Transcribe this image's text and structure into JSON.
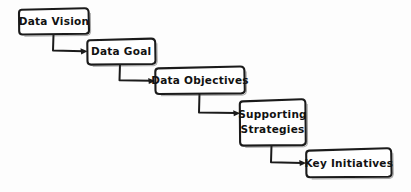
{
  "diagram": {
    "type": "flowchart",
    "orientation": "diagonal-cascade",
    "style": "hand-drawn-sketch",
    "background_color": "#fdfdfd",
    "stroke_color": "#1b1b1b",
    "text_color": "#121212",
    "nodes": [
      {
        "id": "data-vision",
        "label": "Data Vision",
        "lines": [
          "Data Vision"
        ],
        "x": 19,
        "y": 8,
        "width": 70,
        "height": 26
      },
      {
        "id": "data-goal",
        "label": "Data Goal",
        "lines": [
          "Data Goal"
        ],
        "x": 87,
        "y": 38,
        "width": 68,
        "height": 26
      },
      {
        "id": "data-objectives",
        "label": "Data Objectives",
        "lines": [
          "Data Objectives"
        ],
        "x": 155,
        "y": 66,
        "width": 89,
        "height": 27
      },
      {
        "id": "supporting-strategies",
        "label": "Supporting Strategies",
        "lines": [
          "Supporting",
          "Strategies"
        ],
        "x": 240,
        "y": 99,
        "width": 65,
        "height": 46
      },
      {
        "id": "key-initiatives",
        "label": "Key Initiatives",
        "lines": [
          "Key Initiatives"
        ],
        "x": 306,
        "y": 148,
        "width": 85,
        "height": 29
      }
    ],
    "edges": [
      {
        "id": "edge-vision-to-goal",
        "from": "data-vision",
        "to": "data-goal",
        "label": "",
        "arrow": "right"
      },
      {
        "id": "edge-goal-to-objectives",
        "from": "data-goal",
        "to": "data-objectives",
        "label": "",
        "arrow": "right"
      },
      {
        "id": "edge-objectives-to-strategies",
        "from": "data-objectives",
        "to": "supporting-strategies",
        "label": "",
        "arrow": "right"
      },
      {
        "id": "edge-strategies-to-initiatives",
        "from": "supporting-strategies",
        "to": "key-initiatives",
        "label": "",
        "arrow": "right"
      }
    ]
  }
}
